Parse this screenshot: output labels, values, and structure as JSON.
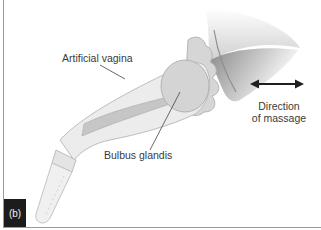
{
  "figure": {
    "panel_label": "(b)",
    "labels": {
      "artificial_vagina": "Artificial vagina",
      "bulbus_glandis": "Bulbus glandis",
      "direction_line1": "Direction",
      "direction_line2": "of massage"
    },
    "icons": {
      "direction_arrow": "double-headed-horizontal-arrow"
    },
    "colors": {
      "device_fill": "#ededed",
      "device_outline": "#bdbdbd",
      "tissue_fill": "#d9d9d9",
      "inner_shaft": "#c4c4c4",
      "skin_shadow": "#9e9e9e",
      "label_text": "#3a3a3a",
      "tag_bg": "#1c1c1c"
    }
  }
}
